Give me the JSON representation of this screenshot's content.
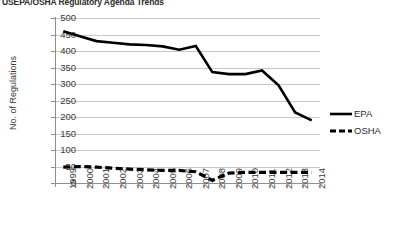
{
  "chart_data": {
    "type": "line",
    "title": "USEPA/OSHA Regulatory Agenda Trends",
    "xlabel": "",
    "ylabel": "No. of Regulations",
    "ylim": [
      0,
      500
    ],
    "ytick_step": 50,
    "grid": true,
    "legend_position": "right",
    "categories": [
      "1999",
      "2000",
      "2001",
      "2002",
      "2003",
      "2004",
      "2005",
      "2006",
      "2007",
      "2008",
      "2009",
      "2010",
      "2011",
      "2012",
      "2013",
      "2014"
    ],
    "yticks": [
      "0",
      "50",
      "100",
      "150",
      "200",
      "250",
      "300",
      "350",
      "400",
      "450",
      "500"
    ],
    "series": [
      {
        "name": "EPA",
        "style": "solid",
        "color": "#000000",
        "values": [
          460,
          445,
          430,
          425,
          420,
          418,
          414,
          404,
          415,
          336,
          330,
          330,
          341,
          296,
          214,
          190
        ]
      },
      {
        "name": "OSHA",
        "style": "dashed",
        "color": "#000000",
        "values": [
          48,
          50,
          48,
          45,
          42,
          40,
          38,
          38,
          34,
          8,
          30,
          32,
          32,
          32,
          32,
          32
        ]
      }
    ]
  },
  "legend": {
    "entries": [
      {
        "label": "EPA",
        "style": "solid"
      },
      {
        "label": "OSHA",
        "style": "dashed"
      }
    ]
  }
}
